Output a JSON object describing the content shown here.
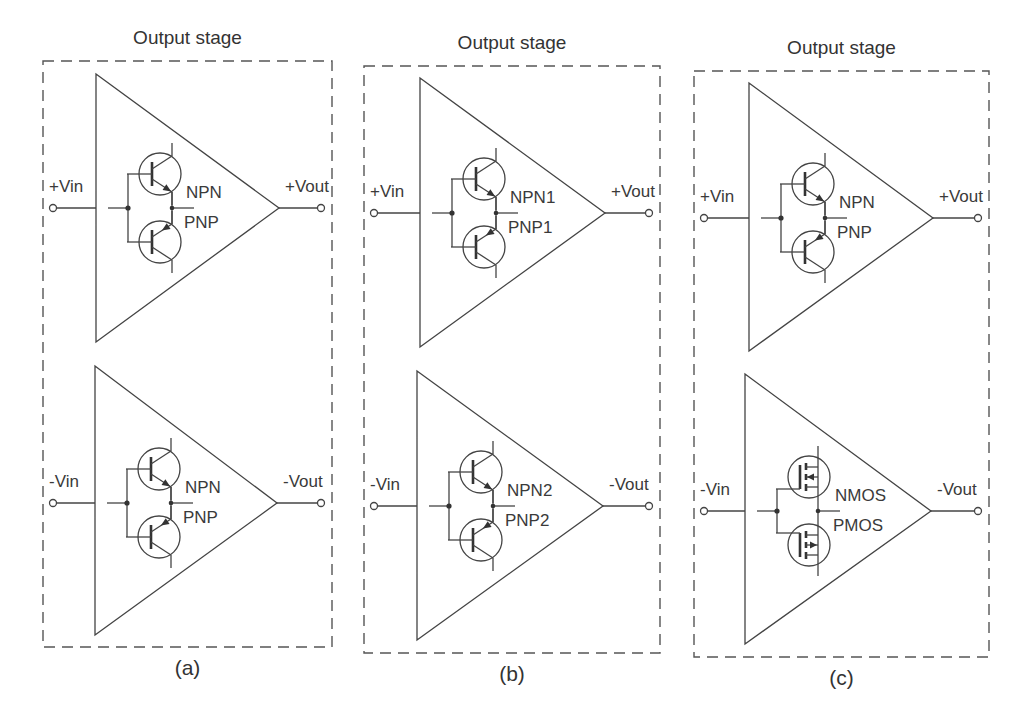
{
  "figure": {
    "panels": [
      {
        "id": "a",
        "title": "Output stage",
        "caption": "(a)",
        "upper_stage": {
          "input_label": "+Vin",
          "output_label": "+Vout",
          "device_type": "bjt",
          "top_device_label": "NPN",
          "bottom_device_label": "PNP"
        },
        "lower_stage": {
          "input_label": "-Vin",
          "output_label": "-Vout",
          "device_type": "bjt",
          "top_device_label": "NPN",
          "bottom_device_label": "PNP"
        }
      },
      {
        "id": "b",
        "title": "Output stage",
        "caption": "(b)",
        "upper_stage": {
          "input_label": "+Vin",
          "output_label": "+Vout",
          "device_type": "bjt",
          "top_device_label": "NPN1",
          "bottom_device_label": "PNP1"
        },
        "lower_stage": {
          "input_label": "-Vin",
          "output_label": "-Vout",
          "device_type": "bjt",
          "top_device_label": "NPN2",
          "bottom_device_label": "PNP2"
        }
      },
      {
        "id": "c",
        "title": "Output stage",
        "caption": "(c)",
        "upper_stage": {
          "input_label": "+Vin",
          "output_label": "+Vout",
          "device_type": "bjt",
          "top_device_label": "NPN",
          "bottom_device_label": "PNP"
        },
        "lower_stage": {
          "input_label": "-Vin",
          "output_label": "-Vout",
          "device_type": "mosfet",
          "top_device_label": "NMOS",
          "bottom_device_label": "PMOS"
        }
      }
    ],
    "colors": {
      "line": "#444444",
      "text": "#333333",
      "background": "#ffffff"
    }
  }
}
